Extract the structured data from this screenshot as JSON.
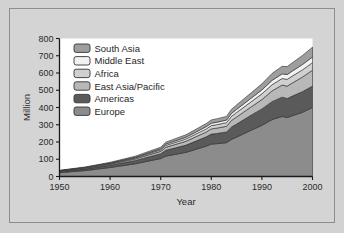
{
  "figure": {
    "background_color": "#d2d2d2",
    "frame_border_color": "#8e8e8e",
    "plot_background_color": "#ffffff",
    "axis_color": "#1a1a1a"
  },
  "chart_data": {
    "type": "area",
    "stacked": true,
    "title": "",
    "xlabel": "Year",
    "ylabel": "Million",
    "xlim": [
      1950,
      2000
    ],
    "ylim": [
      0,
      800
    ],
    "grid": false,
    "legend_position": "top-left",
    "xticks": [
      1950,
      1960,
      1970,
      1980,
      1990,
      2000
    ],
    "xtick_labels": [
      "1950",
      "1960",
      "1970",
      "1980",
      "1990",
      "2000"
    ],
    "yticks": [
      0,
      100,
      200,
      300,
      400,
      500,
      600,
      700,
      800
    ],
    "ytick_labels": [
      "0",
      "100",
      "200",
      "300",
      "400",
      "500",
      "600",
      "700",
      "800"
    ],
    "x": [
      1950,
      1955,
      1960,
      1965,
      1970,
      1971,
      1975,
      1979,
      1980,
      1981,
      1983,
      1984,
      1985,
      1988,
      1990,
      1992,
      1994,
      1995,
      1996,
      1998,
      2000
    ],
    "series": [
      {
        "name": "Europe",
        "color": "#8c8c8c",
        "values": [
          22,
          34,
          52,
          74,
          104,
          118,
          140,
          176,
          188,
          190,
          196,
          215,
          228,
          270,
          296,
          330,
          348,
          342,
          352,
          372,
          400
        ]
      },
      {
        "name": "Americas",
        "color": "#5a5a5a",
        "values": [
          6,
          9,
          13,
          19,
          28,
          34,
          42,
          54,
          58,
          59,
          62,
          72,
          76,
          88,
          96,
          104,
          112,
          110,
          114,
          120,
          124
        ]
      },
      {
        "name": "East Asia/Pacific",
        "color": "#b8b8b8",
        "values": [
          3,
          4,
          6,
          9,
          14,
          17,
          22,
          28,
          30,
          31,
          33,
          38,
          41,
          48,
          54,
          62,
          70,
          72,
          76,
          84,
          92
        ]
      },
      {
        "name": "Africa",
        "color": "#d0d0d0",
        "values": [
          2,
          3,
          4,
          6,
          9,
          11,
          14,
          18,
          19,
          20,
          21,
          24,
          26,
          30,
          33,
          36,
          38,
          39,
          40,
          42,
          44
        ]
      },
      {
        "name": "Middle East",
        "color": "#f2f2f2",
        "values": [
          1,
          2,
          3,
          4,
          6,
          8,
          10,
          13,
          14,
          14,
          15,
          17,
          18,
          21,
          23,
          25,
          27,
          28,
          29,
          31,
          33
        ]
      },
      {
        "name": "South Asia",
        "color": "#9e9e9e",
        "values": [
          2,
          3,
          4,
          6,
          9,
          11,
          14,
          18,
          19,
          20,
          21,
          24,
          26,
          31,
          35,
          40,
          44,
          46,
          48,
          52,
          57
        ]
      }
    ],
    "legend_entries": [
      {
        "label": "South Asia",
        "color": "#9e9e9e"
      },
      {
        "label": "Middle East",
        "color": "#f2f2f2"
      },
      {
        "label": "Africa",
        "color": "#d0d0d0"
      },
      {
        "label": "East Asia/Pacific",
        "color": "#b8b8b8"
      },
      {
        "label": "Americas",
        "color": "#5a5a5a"
      },
      {
        "label": "Europe",
        "color": "#8c8c8c"
      }
    ]
  }
}
